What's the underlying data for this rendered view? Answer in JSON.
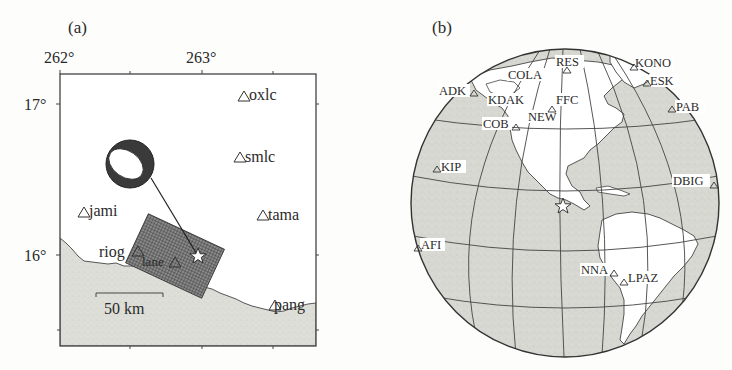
{
  "figure": {
    "panels": [
      {
        "id": "a",
        "label": "(a)",
        "type": "regional-map",
        "x_ticks": [
          {
            "value": 262,
            "label": "262°"
          },
          {
            "value": 263,
            "label": "263°"
          }
        ],
        "y_ticks": [
          {
            "value": 17,
            "label": "17°"
          },
          {
            "value": 16,
            "label": "16°"
          }
        ],
        "lon_range": [
          262.0,
          263.8
        ],
        "lat_range": [
          15.6,
          17.2
        ],
        "scale_bar": {
          "label": "50 km",
          "length_km": 50
        },
        "stations": [
          {
            "name": "oxlc",
            "lon": 263.35,
            "lat": 17.07,
            "label_side": "right"
          },
          {
            "name": "smlc",
            "lon": 263.34,
            "lat": 16.65,
            "label_side": "right"
          },
          {
            "name": "jami",
            "lon": 262.11,
            "lat": 16.3,
            "label_side": "right"
          },
          {
            "name": "tama",
            "lon": 263.5,
            "lat": 16.25,
            "label_side": "right"
          },
          {
            "name": "riog",
            "lon": 262.52,
            "lat": 16.01,
            "label_side": "left"
          },
          {
            "name": "lane",
            "lon": 262.8,
            "lat": 15.97,
            "label_side": "left-sub"
          },
          {
            "name": "pang",
            "lon": 263.55,
            "lat": 15.67,
            "label_side": "right"
          }
        ],
        "epicenter": {
          "symbol": "star",
          "lon": 262.98,
          "lat": 15.98
        },
        "focal_mechanism": {
          "lon": 262.3,
          "lat": 16.6,
          "style": "beachball"
        },
        "rupture_plane": {
          "style": "hatched-rectangle"
        },
        "land_color": "#dcdcd6",
        "sea_color": "#ffffff"
      },
      {
        "id": "b",
        "label": "(b)",
        "type": "globe",
        "stations": [
          {
            "name": "RES"
          },
          {
            "name": "KONO"
          },
          {
            "name": "COLA"
          },
          {
            "name": "ESK"
          },
          {
            "name": "ADK"
          },
          {
            "name": "KDAK"
          },
          {
            "name": "FFC"
          },
          {
            "name": "PAB"
          },
          {
            "name": "COB"
          },
          {
            "name": "NEW"
          },
          {
            "name": "KIP"
          },
          {
            "name": "DBIG"
          },
          {
            "name": "AFI"
          },
          {
            "name": "NNA"
          },
          {
            "name": "LPAZ"
          }
        ],
        "epicenter": {
          "symbol": "star"
        },
        "ocean_color": "#d6d6d0",
        "land_color": "#ffffff"
      }
    ]
  }
}
